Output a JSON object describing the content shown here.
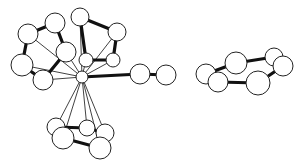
{
  "diagram": {
    "type": "ball-and-stick-molecule",
    "colors": {
      "atom_fill": "#ffffff",
      "atom_stroke": "#222222",
      "bond": "#111111",
      "background": "#ffffff"
    },
    "metal_center": {
      "id": "M",
      "x": 82,
      "y": 77,
      "r": 6
    },
    "atoms": [
      {
        "id": "A",
        "x": 28,
        "y": 34,
        "r": 10
      },
      {
        "id": "B",
        "x": 55,
        "y": 23,
        "r": 10
      },
      {
        "id": "C",
        "x": 80,
        "y": 17,
        "r": 9
      },
      {
        "id": "D",
        "x": 117,
        "y": 32,
        "r": 9
      },
      {
        "id": "E",
        "x": 66,
        "y": 52,
        "r": 10
      },
      {
        "id": "F",
        "x": 22,
        "y": 65,
        "r": 11
      },
      {
        "id": "G",
        "x": 43,
        "y": 80,
        "r": 10
      },
      {
        "id": "H",
        "x": 86,
        "y": 60,
        "r": 7
      },
      {
        "id": "I",
        "x": 113,
        "y": 60,
        "r": 7
      },
      {
        "id": "J",
        "x": 140,
        "y": 74,
        "r": 10
      },
      {
        "id": "K",
        "x": 166,
        "y": 75,
        "r": 10
      },
      {
        "id": "L",
        "x": 206,
        "y": 74,
        "r": 10
      },
      {
        "id": "S",
        "x": 218,
        "y": 82,
        "r": 10
      },
      {
        "id": "N",
        "x": 236,
        "y": 63,
        "r": 11
      },
      {
        "id": "R",
        "x": 258,
        "y": 83,
        "r": 12
      },
      {
        "id": "P",
        "x": 274,
        "y": 57,
        "r": 9
      },
      {
        "id": "Q",
        "x": 283,
        "y": 66,
        "r": 10
      },
      {
        "id": "T",
        "x": 56,
        "y": 127,
        "r": 9
      },
      {
        "id": "V",
        "x": 87,
        "y": 128,
        "r": 8
      },
      {
        "id": "W",
        "x": 105,
        "y": 133,
        "r": 9
      },
      {
        "id": "U",
        "x": 63,
        "y": 138,
        "r": 11
      },
      {
        "id": "X",
        "x": 100,
        "y": 148,
        "r": 11
      }
    ],
    "thick_bonds": [
      [
        "A",
        "B"
      ],
      [
        "A",
        "F"
      ],
      [
        "B",
        "E"
      ],
      [
        "C",
        "D"
      ],
      [
        "C",
        "H"
      ],
      [
        "D",
        "I"
      ],
      [
        "H",
        "I"
      ],
      [
        "E",
        "G"
      ],
      [
        "F",
        "G"
      ],
      [
        "M",
        "J"
      ],
      [
        "J",
        "K"
      ],
      [
        "L",
        "N"
      ],
      [
        "N",
        "P"
      ],
      [
        "P",
        "Q"
      ],
      [
        "Q",
        "R"
      ],
      [
        "R",
        "S"
      ],
      [
        "S",
        "L"
      ],
      [
        "T",
        "V"
      ],
      [
        "V",
        "W"
      ],
      [
        "W",
        "X"
      ],
      [
        "X",
        "U"
      ],
      [
        "U",
        "T"
      ]
    ],
    "thin_bonds": [
      [
        "M",
        "A"
      ],
      [
        "M",
        "C"
      ],
      [
        "M",
        "D"
      ],
      [
        "M",
        "E"
      ],
      [
        "M",
        "F"
      ],
      [
        "M",
        "G"
      ],
      [
        "M",
        "H"
      ],
      [
        "M",
        "I"
      ],
      [
        "M",
        "T"
      ],
      [
        "M",
        "U"
      ],
      [
        "M",
        "V"
      ],
      [
        "M",
        "W"
      ],
      [
        "M",
        "X"
      ]
    ]
  }
}
